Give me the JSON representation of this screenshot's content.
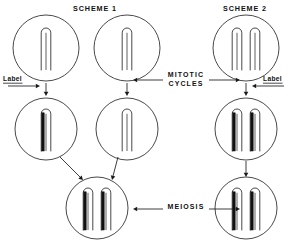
{
  "figure": {
    "width": 293,
    "height": 241,
    "background": "#ffffff",
    "ink_color": "#1a1a1a",
    "labeled_strand_color": "#111111",
    "unlabeled_strand_color": "#ffffff"
  },
  "headers": [
    {
      "id": "scheme-1",
      "text": "SCHEME 1",
      "x": 95,
      "y": 11
    },
    {
      "id": "scheme-2",
      "text": "SCHEME 2",
      "x": 245,
      "y": 11
    }
  ],
  "stage_labels": [
    {
      "id": "mitotic-cycles",
      "line1": "MITOTIC",
      "line2": "CYCLES",
      "x": 186,
      "y": 77
    },
    {
      "id": "meiosis",
      "line1": "MEIOSIS",
      "line2": "",
      "x": 186,
      "y": 209
    }
  ],
  "side_labels": [
    {
      "id": "label-left",
      "text": "Label",
      "x": 3,
      "y": 81
    },
    {
      "id": "label-right",
      "text": "Label",
      "x": 263,
      "y": 81
    }
  ],
  "cells": [
    {
      "id": "scheme1-parent-a",
      "scheme": "SCHEME 1",
      "row": "top",
      "cx": 46,
      "cy": 48,
      "r": 33,
      "chromosomes": [
        {
          "id": "c1",
          "offset": 0,
          "left_strand": "unlabeled",
          "right_strand": "unlabeled"
        }
      ]
    },
    {
      "id": "scheme1-parent-b",
      "scheme": "SCHEME 1",
      "row": "top",
      "cx": 127,
      "cy": 48,
      "r": 33,
      "chromosomes": [
        {
          "id": "c1",
          "offset": 0,
          "left_strand": "unlabeled",
          "right_strand": "unlabeled"
        }
      ]
    },
    {
      "id": "scheme2-parent",
      "scheme": "SCHEME 2",
      "row": "top",
      "cx": 246,
      "cy": 48,
      "r": 33,
      "chromosomes": [
        {
          "id": "c1",
          "offset": -9,
          "left_strand": "unlabeled",
          "right_strand": "unlabeled"
        },
        {
          "id": "c2",
          "offset": 9,
          "left_strand": "unlabeled",
          "right_strand": "unlabeled"
        }
      ]
    },
    {
      "id": "scheme1-labeled-gamete-parent",
      "scheme": "SCHEME 1",
      "row": "middle",
      "cx": 46,
      "cy": 129,
      "r": 31,
      "chromosomes": [
        {
          "id": "c1",
          "offset": 0,
          "left_strand": "labeled",
          "right_strand": "unlabeled"
        }
      ]
    },
    {
      "id": "scheme1-unlabeled-gamete-parent",
      "scheme": "SCHEME 1",
      "row": "middle",
      "cx": 127,
      "cy": 129,
      "r": 31,
      "chromosomes": [
        {
          "id": "c1",
          "offset": 0,
          "left_strand": "unlabeled",
          "right_strand": "unlabeled"
        }
      ]
    },
    {
      "id": "scheme2-labeled-diploid",
      "scheme": "SCHEME 2",
      "row": "middle",
      "cx": 246,
      "cy": 129,
      "r": 31,
      "chromosomes": [
        {
          "id": "c1",
          "offset": -9,
          "left_strand": "labeled",
          "right_strand": "unlabeled"
        },
        {
          "id": "c2",
          "offset": 9,
          "left_strand": "labeled",
          "right_strand": "unlabeled"
        }
      ]
    },
    {
      "id": "scheme1-zygote",
      "scheme": "SCHEME 1",
      "row": "bottom",
      "cx": 97,
      "cy": 208,
      "r": 31,
      "chromosomes": [
        {
          "id": "c1",
          "offset": -9,
          "left_strand": "labeled",
          "right_strand": "unlabeled"
        },
        {
          "id": "c2",
          "offset": 9,
          "left_strand": "labeled",
          "right_strand": "unlabeled"
        }
      ]
    },
    {
      "id": "scheme2-zygote",
      "scheme": "SCHEME 2",
      "row": "bottom",
      "cx": 246,
      "cy": 208,
      "r": 31,
      "chromosomes": [
        {
          "id": "c1",
          "offset": -9,
          "left_strand": "labeled",
          "right_strand": "unlabeled"
        },
        {
          "id": "c2",
          "offset": 9,
          "left_strand": "labeled",
          "right_strand": "unlabeled"
        }
      ]
    }
  ],
  "arrows": [
    {
      "id": "arrow-s1a-down",
      "kind": "vertical-down",
      "x1": 46,
      "y1": 83,
      "x2": 46,
      "y2": 96
    },
    {
      "id": "arrow-s1b-down",
      "kind": "vertical-down",
      "x1": 127,
      "y1": 83,
      "x2": 127,
      "y2": 96
    },
    {
      "id": "arrow-s2-down",
      "kind": "vertical-down",
      "x1": 246,
      "y1": 83,
      "x2": 246,
      "y2": 96
    },
    {
      "id": "arrow-label-left",
      "kind": "horizontal-right",
      "x1": 8,
      "y1": 86,
      "x2": 40,
      "y2": 86
    },
    {
      "id": "arrow-label-right",
      "kind": "horizontal-left",
      "x1": 284,
      "y1": 86,
      "x2": 252,
      "y2": 86
    },
    {
      "id": "arrow-mitotic-left",
      "kind": "horizontal-left",
      "x1": 163,
      "y1": 80,
      "x2": 133,
      "y2": 80
    },
    {
      "id": "arrow-mitotic-right",
      "kind": "horizontal-right",
      "x1": 209,
      "y1": 80,
      "x2": 240,
      "y2": 80
    },
    {
      "id": "arrow-s1a-diagonal",
      "kind": "diagonal-down-right",
      "x1": 60,
      "y1": 157,
      "x2": 83,
      "y2": 180
    },
    {
      "id": "arrow-s1b-diagonal",
      "kind": "diagonal-down-left",
      "x1": 118,
      "y1": 157,
      "x2": 112,
      "y2": 180
    },
    {
      "id": "arrow-s2-mid-down",
      "kind": "vertical-down",
      "x1": 246,
      "y1": 161,
      "x2": 246,
      "y2": 177
    },
    {
      "id": "arrow-meiosis-left",
      "kind": "horizontal-left",
      "x1": 163,
      "y1": 209,
      "x2": 133,
      "y2": 209
    },
    {
      "id": "arrow-meiosis-right",
      "kind": "horizontal-right",
      "x1": 209,
      "y1": 209,
      "x2": 240,
      "y2": 209
    }
  ]
}
